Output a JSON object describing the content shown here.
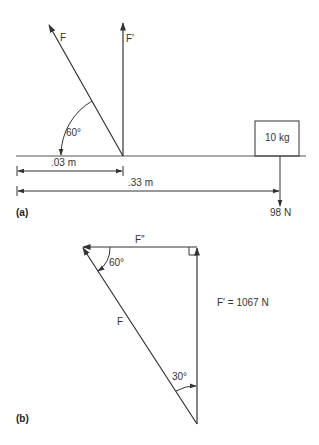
{
  "figure_a": {
    "panel_label": "(a)",
    "force_F_label": "F",
    "force_Fprime_label": "F′",
    "angle_label": "60°",
    "mass_label": "10 kg",
    "dim_short_label": ".03 m",
    "dim_long_label": ".33 m",
    "weight_label": "98 N"
  },
  "figure_b": {
    "panel_label": "(b)",
    "force_Fdoubleprime_label": "F″",
    "force_F_label": "F",
    "angle_top_label": "60°",
    "angle_bottom_label": "30°",
    "result_label": "F′ = 1067 N"
  },
  "colors": {
    "line": "#333333",
    "text": "#333333",
    "background": "#ffffff"
  }
}
